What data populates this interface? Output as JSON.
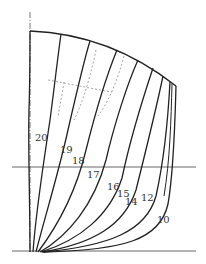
{
  "diagram": {
    "type": "ship-body-plan",
    "colors": {
      "line": "#222222",
      "guide": "#555555",
      "dashed": "#9a9a9a",
      "label": "#333333"
    },
    "centerline": {
      "x": 30,
      "y1": 12,
      "y2": 252,
      "style": "dash-dot"
    },
    "baseline": {
      "y": 251,
      "x1": 12,
      "x2": 196
    },
    "waterline": {
      "y": 167,
      "x1": 12,
      "x2": 196
    },
    "deck": {
      "path": "M30,31 Q110,34 176,86"
    },
    "stations": [
      {
        "label": "20",
        "path": "M30,252 C30,200 28,150 29,110 C30,80 30,50 30,31",
        "label_x": 35,
        "label_y": 141
      },
      {
        "label": "19",
        "path": "M33,252 C36,210 44,160 50,120 C54,90 58,55 61,34",
        "label_x": 60,
        "label_y": 153
      },
      {
        "label": "18",
        "path": "M36,252 C44,220 58,175 68,130 C76,95 84,60 90,41",
        "label_x": 72,
        "label_y": 164
      },
      {
        "label": "17",
        "path": "M38,252 C56,228 76,192 86,150 C96,110 108,72 117,50",
        "label_x": 87,
        "label_y": 178
      },
      {
        "label": "16",
        "path": "M40,252 C68,236 94,205 106,160 C114,125 128,82 138,60",
        "label_x": 107,
        "label_y": 190
      },
      {
        "label": "15",
        "path": "M41,252 C80,240 110,215 122,178 C130,140 144,95 153,68",
        "label_x": 117,
        "label_y": 197
      },
      {
        "label": "14",
        "path": "M42,252 C92,244 124,226 136,190 C146,150 156,110 163,76",
        "label_x": 125,
        "label_y": 205
      },
      {
        "label": "12",
        "path": "M43,252 C108,246 146,232 156,196 C164,160 168,120 170,82",
        "label_x": 141,
        "label_y": 201
      },
      {
        "label": "10",
        "path": "M44,252 C124,250 160,240 168,204 C174,170 175,120 176,86",
        "label_x": 157,
        "label_y": 223
      }
    ],
    "dashed_lines": [
      {
        "path": "M64,82 C62,95 60,105 58,116"
      },
      {
        "path": "M96,50 C92,70 84,100 74,120"
      },
      {
        "path": "M48,80 C70,84 88,88 112,92"
      },
      {
        "path": "M124,56 C118,78 110,100 98,116"
      }
    ]
  }
}
